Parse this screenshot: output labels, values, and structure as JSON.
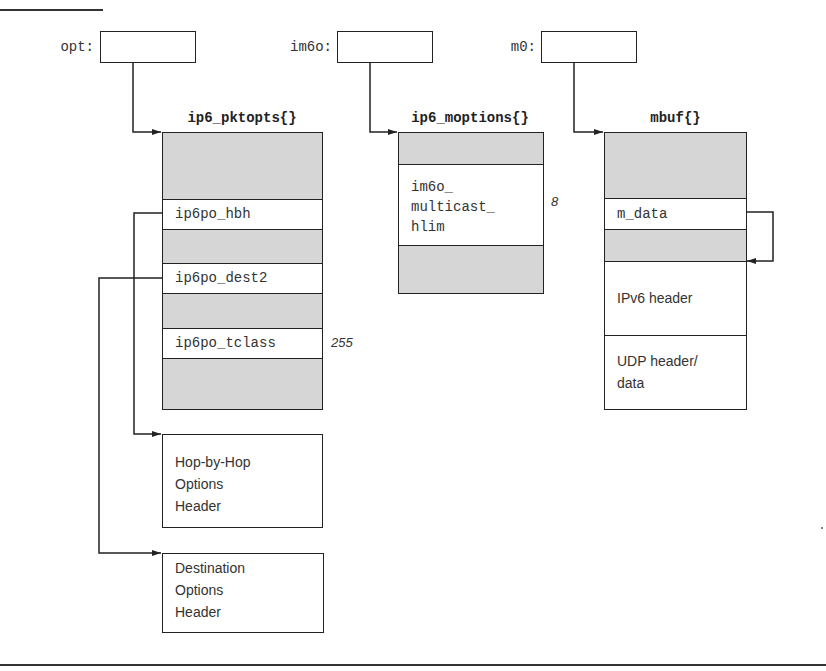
{
  "pointers": [
    {
      "id": "opt",
      "label": "opt:"
    },
    {
      "id": "im6o",
      "label": "im6o:"
    },
    {
      "id": "m0",
      "label": "m0:"
    }
  ],
  "structs": {
    "ip6_pktopts": {
      "title": "ip6_pktopts{}",
      "fields": [
        {
          "name": "ip6po_hbh",
          "value": ""
        },
        {
          "name": "ip6po_dest2",
          "value": ""
        },
        {
          "name": "ip6po_tclass",
          "value": "255"
        }
      ]
    },
    "ip6_moptions": {
      "title": "ip6_moptions{}",
      "fields": [
        {
          "name": "im6o_\nmulticast_\nhlim",
          "value": "8"
        }
      ]
    },
    "mbuf": {
      "title": "mbuf{}",
      "fields": [
        {
          "name": "m_data"
        }
      ],
      "data_regions": [
        {
          "label": "IPv6 header"
        },
        {
          "label": "UDP header/\ndata"
        }
      ]
    }
  },
  "headers": [
    {
      "id": "hbh",
      "label": "Hop-by-Hop\nOptions\nHeader"
    },
    {
      "id": "dest",
      "label": "Destination\nOptions\nHeader"
    }
  ],
  "colors": {
    "line": "#222222",
    "shaded_field": "#d6d6d6",
    "background": "#ffffff"
  }
}
